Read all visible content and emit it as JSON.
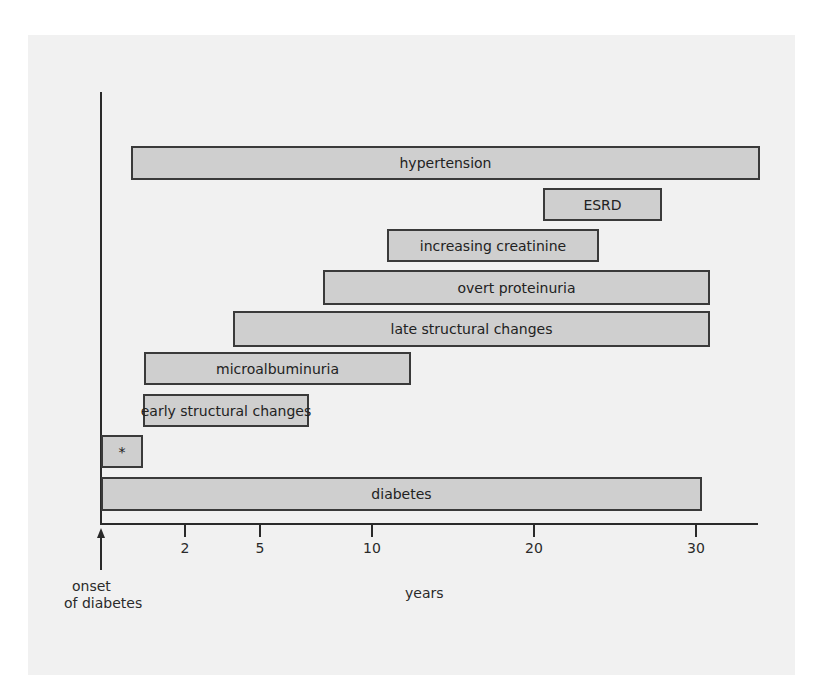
{
  "figure": {
    "panel_color": "#f1f1f1",
    "bar_fill": "#cfcfcf",
    "bar_border": "#3a3a3a",
    "onset_label_line1": "onset",
    "onset_label_line2": "of diabetes",
    "x_axis_label": "years"
  },
  "axis": {
    "ticks": [
      {
        "label": "2",
        "x": 185
      },
      {
        "label": "5",
        "x": 260
      },
      {
        "label": "10",
        "x": 372
      },
      {
        "label": "20",
        "x": 534
      },
      {
        "label": "30",
        "x": 696
      }
    ]
  },
  "bars": [
    {
      "label": "hypertension",
      "left": 131,
      "top": 146,
      "width": 629,
      "height": 34
    },
    {
      "label": "ESRD",
      "left": 543,
      "top": 188,
      "width": 119,
      "height": 33
    },
    {
      "label": "increasing creatinine",
      "left": 387,
      "top": 229,
      "width": 212,
      "height": 33
    },
    {
      "label": "overt proteinuria",
      "left": 323,
      "top": 270,
      "width": 387,
      "height": 35
    },
    {
      "label": "late structural changes",
      "left": 233,
      "top": 311,
      "width": 477,
      "height": 36
    },
    {
      "label": "microalbuminuria",
      "left": 144,
      "top": 352,
      "width": 267,
      "height": 33
    },
    {
      "label": "early structural changes",
      "left": 143,
      "top": 394,
      "width": 166,
      "height": 33
    },
    {
      "label": "*",
      "left": 101,
      "top": 435,
      "width": 42,
      "height": 33
    },
    {
      "label": "diabetes",
      "left": 101,
      "top": 477,
      "width": 601,
      "height": 34
    }
  ],
  "chart_data": {
    "type": "bar",
    "orientation": "horizontal-timeline",
    "title": "",
    "xlabel": "years",
    "ylabel": "",
    "x_ticks": [
      "2",
      "5",
      "10",
      "20",
      "30"
    ],
    "x_origin_label": "onset of diabetes",
    "series": [
      {
        "name": "hypertension",
        "start_years": 0.5,
        "end_years": 32
      },
      {
        "name": "ESRD",
        "start_years": 21,
        "end_years": 28
      },
      {
        "name": "increasing creatinine",
        "start_years": 12,
        "end_years": 24
      },
      {
        "name": "overt proteinuria",
        "start_years": 8,
        "end_years": 31
      },
      {
        "name": "late structural changes",
        "start_years": 4,
        "end_years": 31
      },
      {
        "name": "microalbuminuria",
        "start_years": 1,
        "end_years": 12
      },
      {
        "name": "early structural changes",
        "start_years": 1,
        "end_years": 7
      },
      {
        "name": "*",
        "start_years": 0,
        "end_years": 1
      },
      {
        "name": "diabetes",
        "start_years": 0,
        "end_years": 30.5
      }
    ],
    "grid": false,
    "legend": "none"
  }
}
